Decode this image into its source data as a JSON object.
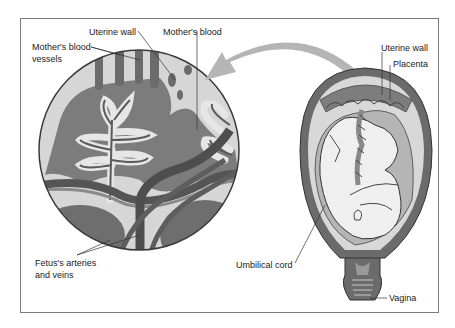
{
  "diagram": {
    "type": "anatomical illustration",
    "colors": {
      "tissue_dark": "#6b6b6b",
      "tissue_mid": "#8e8e8e",
      "tissue_light": "#d6d6d6",
      "vessel": "#5a5a5a",
      "arrow": "#b5b5b5",
      "frame": "#7a7a7a",
      "fetus": "#ececec"
    },
    "labels": {
      "uterine_wall_left": "Uterine wall",
      "mothers_blood": "Mother's blood",
      "mothers_blood_vessels_line1": "Mother's blood",
      "mothers_blood_vessels_line2": "vessels",
      "fetus_vessels_line1": "Fetus's arteries",
      "fetus_vessels_line2": "and veins",
      "uterine_wall_right": "Uterine wall",
      "placenta": "Placenta",
      "umbilical_cord": "Umbilical cord",
      "vagina": "Vagina"
    }
  }
}
